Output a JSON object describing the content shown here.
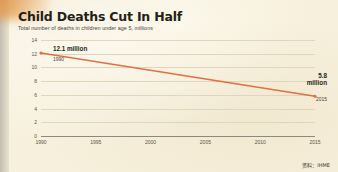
{
  "header": {
    "title": "Child Deaths Cut In Half",
    "subtitle": "Total number of deaths in children under age 5, millions"
  },
  "annotations": {
    "start_value_label": "12.1 million",
    "start_year_label": "1990",
    "end_value_label": "5.8",
    "end_value_unit": "million",
    "end_year_label": "2015"
  },
  "source": {
    "credit": "资料：IHME"
  },
  "colors": {
    "line": "#e0703f",
    "background": "#f7f0dc",
    "gridline": "#ded6bd",
    "axis": "#8e887a",
    "text": "#231f18"
  },
  "chart_data": {
    "type": "line",
    "title": "Child Deaths Cut In Half",
    "subtitle": "Total number of deaths in children under age 5, millions",
    "xlabel": "",
    "ylabel": "Total number of deaths in children under age 5, millions",
    "x": [
      1990,
      2015
    ],
    "xlim": [
      1990,
      2015
    ],
    "ylim": [
      0,
      14
    ],
    "xticks": [
      1990,
      1995,
      2000,
      2005,
      2010,
      2015
    ],
    "yticks": [
      0,
      2,
      4,
      6,
      8,
      10,
      12,
      14
    ],
    "grid": true,
    "legend": false,
    "series": [
      {
        "name": "Child deaths under age 5 (millions)",
        "color": "#e0703f",
        "values": [
          12.1,
          5.8
        ]
      }
    ],
    "point_labels": [
      {
        "x": 1990,
        "y": 12.1,
        "text": "12.1 million"
      },
      {
        "x": 2015,
        "y": 5.8,
        "text": "5.8 million"
      }
    ],
    "source": "IHME"
  }
}
